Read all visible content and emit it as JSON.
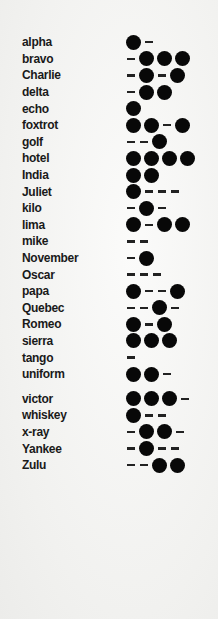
{
  "alphabet": [
    {
      "word": "alpha",
      "code": ".-"
    },
    {
      "word": "bravo",
      "code": "-..."
    },
    {
      "word": "Charlie",
      "code": "-.-."
    },
    {
      "word": "delta",
      "code": "-.."
    },
    {
      "word": "echo",
      "code": "."
    },
    {
      "word": "foxtrot",
      "code": "..-."
    },
    {
      "word": "golf",
      "code": "--."
    },
    {
      "word": "hotel",
      "code": "...."
    },
    {
      "word": "India",
      "code": ".."
    },
    {
      "word": "Juliet",
      "code": ".---"
    },
    {
      "word": "kilo",
      "code": "-.-"
    },
    {
      "word": "lima",
      "code": ".-.."
    },
    {
      "word": "mike",
      "code": "--"
    },
    {
      "word": "November",
      "code": "-."
    },
    {
      "word": "Oscar",
      "code": "---"
    },
    {
      "word": "papa",
      "code": ".--."
    },
    {
      "word": "Quebec",
      "code": "--.-"
    },
    {
      "word": "Romeo",
      "code": ".-."
    },
    {
      "word": "sierra",
      "code": "..."
    },
    {
      "word": "tango",
      "code": "-"
    },
    {
      "word": "uniform",
      "code": "..-"
    },
    {
      "word": "victor",
      "code": "...-"
    },
    {
      "word": "whiskey",
      "code": ".--"
    },
    {
      "word": "x-ray",
      "code": "-..-"
    },
    {
      "word": "Yankee",
      "code": "-.--"
    },
    {
      "word": "Zulu",
      "code": "--.."
    }
  ],
  "colors": {
    "ink": "#080808",
    "paper": "#f4f4f2"
  }
}
